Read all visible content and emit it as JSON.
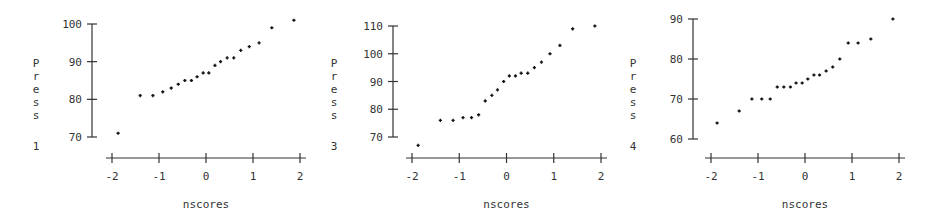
{
  "chart_data": [
    {
      "type": "scatter",
      "title": "",
      "xlabel": "nscores",
      "ylabel": "Press 1",
      "ylabel_letters": [
        "P",
        "r",
        "e",
        "s",
        "s"
      ],
      "ylabel_suffix": "1",
      "xlim": [
        -2,
        2
      ],
      "ylim": [
        70,
        100
      ],
      "xticks": [
        -2,
        -1,
        0,
        1,
        2
      ],
      "yticks": [
        70,
        80,
        90,
        100
      ],
      "grid": false,
      "x": [
        -1.87,
        -1.4,
        -1.13,
        -0.92,
        -0.74,
        -0.59,
        -0.45,
        -0.31,
        -0.19,
        -0.06,
        0.06,
        0.19,
        0.31,
        0.45,
        0.59,
        0.74,
        0.92,
        1.13,
        1.4,
        1.87
      ],
      "y": [
        71,
        81,
        81,
        82,
        83,
        84,
        85,
        85,
        86,
        87,
        87,
        89,
        90,
        91,
        91,
        93,
        94,
        95,
        99,
        101
      ]
    },
    {
      "type": "scatter",
      "title": "",
      "xlabel": "nscores",
      "ylabel": "Press 3",
      "ylabel_letters": [
        "P",
        "r",
        "e",
        "s",
        "s"
      ],
      "ylabel_suffix": "3",
      "xlim": [
        -2,
        2
      ],
      "ylim": [
        70,
        110
      ],
      "xticks": [
        -2,
        -1,
        0,
        1,
        2
      ],
      "yticks": [
        70,
        80,
        90,
        100,
        110
      ],
      "grid": false,
      "x": [
        -1.87,
        -1.4,
        -1.13,
        -0.92,
        -0.74,
        -0.59,
        -0.45,
        -0.31,
        -0.19,
        -0.06,
        0.06,
        0.19,
        0.31,
        0.45,
        0.59,
        0.74,
        0.92,
        1.13,
        1.4,
        1.87
      ],
      "y": [
        67,
        76,
        76,
        77,
        77,
        78,
        83,
        85,
        87,
        90,
        92,
        92,
        93,
        93,
        95,
        97,
        100,
        103,
        109,
        110
      ]
    },
    {
      "type": "scatter",
      "title": "",
      "xlabel": "nscores",
      "ylabel": "Press 4",
      "ylabel_letters": [
        "P",
        "r",
        "e",
        "s",
        "s"
      ],
      "ylabel_suffix": "4",
      "xlim": [
        -2,
        2
      ],
      "ylim": [
        60,
        90
      ],
      "xticks": [
        -2,
        -1,
        0,
        1,
        2
      ],
      "yticks": [
        60,
        70,
        80,
        90
      ],
      "grid": false,
      "x": [
        -1.87,
        -1.4,
        -1.13,
        -0.92,
        -0.74,
        -0.59,
        -0.45,
        -0.31,
        -0.19,
        -0.06,
        0.06,
        0.19,
        0.31,
        0.45,
        0.59,
        0.74,
        0.92,
        1.13,
        1.4,
        1.87
      ],
      "y": [
        64,
        67,
        70,
        70,
        70,
        73,
        73,
        73,
        74,
        74,
        75,
        76,
        76,
        77,
        78,
        80,
        84,
        84,
        85,
        90
      ]
    }
  ]
}
